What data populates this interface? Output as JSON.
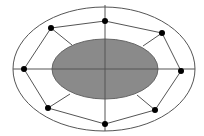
{
  "diagram": {
    "colors": {
      "background": "#ffffff",
      "line": "#555555",
      "inner_fill": "#8a8a8a",
      "inner_stroke": "#666666",
      "node": "#000000"
    },
    "outer_ellipse": {
      "cx": 104,
      "cy": 69,
      "rx": 91,
      "ry": 62
    },
    "inner_ellipse": {
      "cx": 105,
      "cy": 69,
      "rx": 53,
      "ry": 30
    },
    "axes": {
      "horizontal": {
        "x1": 13,
        "y1": 69,
        "x2": 195,
        "y2": 69
      },
      "vertical": {
        "x1": 105,
        "y1": 5,
        "x2": 105,
        "y2": 131
      }
    },
    "nodes": [
      {
        "id": "top",
        "x": 105,
        "y": 21
      },
      {
        "id": "top-right",
        "x": 162,
        "y": 33
      },
      {
        "id": "right",
        "x": 181,
        "y": 71
      },
      {
        "id": "bottom-right",
        "x": 155,
        "y": 110
      },
      {
        "id": "bottom",
        "x": 105,
        "y": 124
      },
      {
        "id": "bottom-left",
        "x": 48,
        "y": 108
      },
      {
        "id": "left",
        "x": 24,
        "y": 69
      },
      {
        "id": "top-left",
        "x": 51,
        "y": 28
      }
    ],
    "spokes": [
      {
        "id": "top-left",
        "x1": 51,
        "y1": 28,
        "x2": 72,
        "y2": 45
      },
      {
        "id": "top-right",
        "x1": 162,
        "y1": 33,
        "x2": 143,
        "y2": 46
      },
      {
        "id": "bottom-right",
        "x1": 155,
        "y1": 110,
        "x2": 137,
        "y2": 95
      },
      {
        "id": "bottom-left",
        "x1": 48,
        "y1": 108,
        "x2": 70,
        "y2": 94
      }
    ],
    "node_radius": 3
  }
}
